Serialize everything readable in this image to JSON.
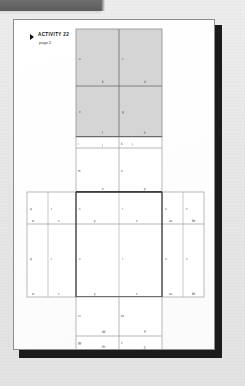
{
  "window": {
    "top_bar_color": "#636363",
    "page_background": "#ffffff",
    "desktop_background": "#e9e9e9",
    "shadow_color": "#1b1b1b"
  },
  "header": {
    "marker_icon": "right-triangle-bullet-icon",
    "title": "ACTIVITY 22",
    "subtitle": "page 2"
  },
  "diagram": {
    "name": "cube-net-unfolding",
    "shade_color": "#d5d5d5",
    "line_color": "#9a9a9a",
    "heavy_line_color": "#333333",
    "panels": [
      {
        "id": "top-shaded-panel",
        "shaded": true,
        "rows": 2,
        "cols": 2,
        "cells": [
          {
            "left": "a",
            "bottom": "b"
          },
          {
            "left": "c",
            "bottom": "d"
          },
          {
            "left": "e",
            "bottom": "f"
          },
          {
            "left": "g",
            "bottom": "h"
          }
        ]
      },
      {
        "id": "upper-middle-panel",
        "shaded": false,
        "rows": 2,
        "cols": 2,
        "cells": [
          {
            "left": "i",
            "bottom": "j"
          },
          {
            "left": "k",
            "bottom": "l"
          },
          {
            "left": "m",
            "bottom": "n"
          },
          {
            "left": "o",
            "bottom": "p"
          }
        ]
      },
      {
        "id": "wide-middle-band",
        "shaded": false,
        "rows": 2,
        "cols": 6,
        "row_labels": [
          "q",
          "r",
          "s",
          "t",
          "u",
          "v"
        ],
        "row2_labels": [
          "w",
          "x",
          "y",
          "z",
          "aa",
          "bb"
        ]
      },
      {
        "id": "lower-panel",
        "shaded": false,
        "rows": 2,
        "cols": 2,
        "cells": [
          {
            "left": "cc",
            "bottom": "dd"
          },
          {
            "left": "ee",
            "bottom": "ff"
          },
          {
            "left": "gg",
            "bottom": "hh"
          },
          {
            "left": "ii",
            "bottom": "jj"
          }
        ]
      }
    ]
  }
}
